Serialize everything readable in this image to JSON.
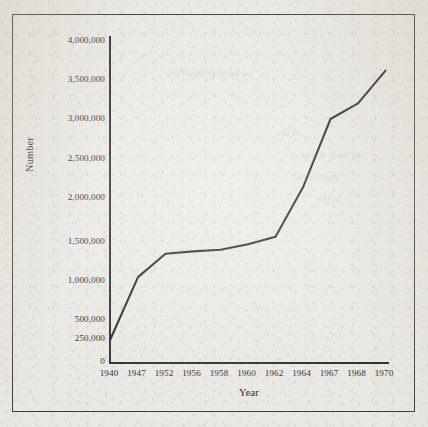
{
  "chart_data": {
    "type": "line",
    "title": "",
    "xlabel": "Year",
    "ylabel": "Number",
    "categories": [
      "1940",
      "1947",
      "1952",
      "1956",
      "1958",
      "1960",
      "1962",
      "1964",
      "1967",
      "1968",
      "1970"
    ],
    "values": [
      250000,
      1050000,
      1350000,
      1380000,
      1400000,
      1470000,
      1560000,
      2130000,
      3000000,
      3200000,
      3620000
    ],
    "series": [
      {
        "name": "Number",
        "values": [
          250000,
          1050000,
          1350000,
          1380000,
          1400000,
          1470000,
          1560000,
          2130000,
          3000000,
          3200000,
          3620000
        ]
      }
    ],
    "ytick_labels": [
      "4,000,000",
      "3,500,000",
      "3,000,000",
      "2,500,000",
      "2,000,000",
      "1,500,000",
      "1,000,000",
      "500,000",
      "250,000",
      "0"
    ],
    "ytick_values": [
      4000000,
      3500000,
      3000000,
      2500000,
      2000000,
      1500000,
      1000000,
      500000,
      250000,
      0
    ],
    "ylim": [
      0,
      4000000
    ],
    "grid": false,
    "legend": false,
    "legend_position": "none",
    "axis_note": "non-linear lower axis: 250,000 tick placed between 0 and 500,000",
    "line_color": "#231f1c",
    "background_color": "#e9e7e2"
  },
  "ghost_text": {
    "line_a": "a large proportion",
    "line_b": "of the",
    "line_c": "increase in the",
    "line_d": "number of",
    "line_e": "in the"
  }
}
